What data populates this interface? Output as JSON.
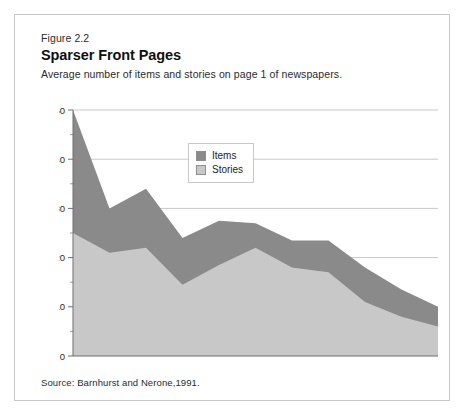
{
  "figure": {
    "number": "Figure 2.2",
    "title": "Sparser Front Pages",
    "subtitle": "Average number of items and stories on page 1 of newspapers.",
    "source": "Source: Barnhurst and Nerone,1991."
  },
  "legend": {
    "items": [
      {
        "label": "Items",
        "color": "#8a8a8a"
      },
      {
        "label": "Stories",
        "color": "#c8c8c8"
      }
    ]
  },
  "chart_data": {
    "type": "area",
    "title": "Sparser Front Pages",
    "subtitle": "Average number of items and stories on page 1 of newspapers.",
    "xlabel": "",
    "ylabel": "",
    "x": [
      1885,
      1895,
      1905,
      1915,
      1925,
      1935,
      1945,
      1955,
      1965,
      1975,
      1985
    ],
    "categories": [
      "1885",
      "1895",
      "1905",
      "1915",
      "1925",
      "1935",
      "1945",
      "1955",
      "1965",
      "1975",
      "1985"
    ],
    "series": [
      {
        "name": "Items",
        "color": "#8a8a8a",
        "values": [
          50,
          30,
          34,
          24,
          27.5,
          27,
          23.5,
          23.5,
          18,
          13.5,
          10
        ]
      },
      {
        "name": "Stories",
        "color": "#c8c8c8",
        "values": [
          25,
          21,
          22,
          14.5,
          18.5,
          22,
          18,
          17,
          11,
          8,
          6
        ]
      }
    ],
    "xlim": [
      1885,
      1985
    ],
    "ylim": [
      0,
      50
    ],
    "yticks": [
      0,
      10,
      20,
      30,
      40,
      50
    ],
    "ytick_labels": [
      "0",
      "10",
      "20",
      "30",
      "40",
      "50"
    ],
    "yminor_ticks": [
      5,
      15,
      25,
      35,
      45
    ],
    "grid": true,
    "grid_axis": "y",
    "legend_position": "upper-center",
    "stacked": false,
    "note": "Items area drawn behind Stories area; both measured from zero baseline."
  }
}
